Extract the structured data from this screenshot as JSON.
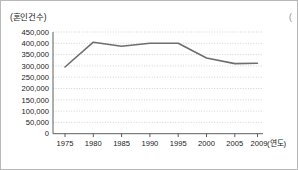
{
  "figure": {
    "corner_clipped_label": "("
  },
  "chart_data": {
    "type": "line",
    "title": "",
    "subtitle": "",
    "xlabel": "(연도)",
    "ylabel": "(혼인건수)",
    "x": [
      1975,
      1980,
      1985,
      1990,
      1995,
      2000,
      2005,
      2009
    ],
    "categories": [
      "1975",
      "1980",
      "1985",
      "1990",
      "1995",
      "2000",
      "2005",
      "2009"
    ],
    "values": [
      295000,
      405000,
      387000,
      400000,
      400000,
      335000,
      310000,
      312000
    ],
    "series": [
      {
        "name": "혼인건수",
        "color": "#6e6e6e",
        "values": [
          295000,
          405000,
          387000,
          400000,
          400000,
          335000,
          310000,
          312000
        ]
      }
    ],
    "xtick_labels": [
      "1975",
      "1980",
      "1985",
      "1990",
      "1995",
      "2000",
      "2005",
      "2009"
    ],
    "ytick_labels": [
      "450,000",
      "400,000",
      "350,000",
      "300,000",
      "250,000",
      "200,000",
      "150,000",
      "100,000",
      "50,000",
      "0"
    ],
    "ytick_values": [
      450000,
      400000,
      350000,
      300000,
      250000,
      200000,
      150000,
      100000,
      50000,
      0
    ],
    "ylim": [
      0,
      450000
    ],
    "xlim": [
      1975,
      2011
    ],
    "grid": "horizontal-dotted",
    "legend": "none"
  }
}
